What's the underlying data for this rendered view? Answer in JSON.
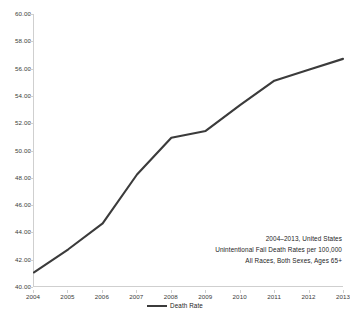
{
  "chart_data": {
    "type": "line",
    "title": "",
    "xlabel": "",
    "ylabel": "",
    "categories": [
      "2004",
      "2005",
      "2006",
      "2007",
      "2008",
      "2009",
      "2010",
      "2011",
      "2012",
      "2013"
    ],
    "series": [
      {
        "name": "Death Rate",
        "color": "#3b3b3b",
        "values": [
          41.0,
          42.7,
          44.6,
          48.2,
          50.9,
          51.4,
          53.3,
          55.1,
          55.9,
          56.7
        ]
      }
    ],
    "ylim": [
      40.0,
      60.0
    ],
    "ytick_step": 2.0,
    "ytick_labels": [
      "60.00",
      "58.00",
      "56.00",
      "54.00",
      "52.00",
      "50.00",
      "48.00",
      "46.00",
      "44.00",
      "42.00",
      "40.00"
    ],
    "ytick_values": [
      60.0,
      58.0,
      56.0,
      54.0,
      52.0,
      50.0,
      48.0,
      46.0,
      44.0,
      42.0,
      40.0
    ],
    "grid": false,
    "legend_position": "bottom",
    "annotations": [
      "2004–2013, United States",
      "Unintentional Fall Death Rates per 100,000",
      "All Races, Both Sexes, Ages 65+"
    ]
  },
  "legend": {
    "entries": [
      {
        "label": "Death Rate",
        "color": "#3b3b3b"
      }
    ]
  },
  "colors": {
    "line": "#3b3b3b",
    "axis": "#cfcfcf",
    "text": "#1d1d1d",
    "background": "#ffffff"
  }
}
